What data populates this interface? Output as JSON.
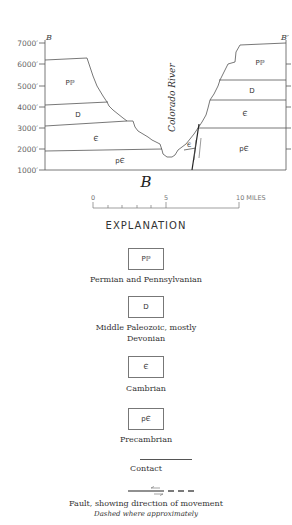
{
  "diagram": {
    "title": "B",
    "section_endpoints": {
      "left": "B",
      "right": "B′"
    },
    "elevation_axis": {
      "ticks": [
        "7000′",
        "6000′",
        "5000′",
        "4000′",
        "3000′",
        "2000′",
        "1000′"
      ]
    },
    "river_label": "Colorado River",
    "units": {
      "left": [
        {
          "symbol": "Pℙ",
          "name": "Permian and Pennsylvanian"
        },
        {
          "symbol": "D",
          "name": "Middle Paleozoic, mostly Devonian"
        },
        {
          "symbol": "Є",
          "name": "Cambrian"
        },
        {
          "symbol": "pЄ",
          "name": "Precambrian"
        }
      ],
      "right": [
        {
          "symbol": "Pℙ"
        },
        {
          "symbol": "D"
        },
        {
          "symbol": "Є"
        },
        {
          "symbol": "pЄ"
        }
      ],
      "fault_block_symbol": "Є"
    },
    "scale_bar": {
      "labels": [
        "0",
        "5",
        "10 MILES"
      ]
    }
  },
  "legend": {
    "heading": "EXPLANATION",
    "items": [
      {
        "symbol": "Pℙ",
        "label": "Permian and Pennsylvanian"
      },
      {
        "symbol": "D",
        "label_line1": "Middle Paleozoic, mostly",
        "label_line2": "Devonian"
      },
      {
        "symbol": "Є",
        "label": "Cambrian"
      },
      {
        "symbol": "pЄ",
        "label": "Precambrian"
      }
    ],
    "contact_label": "Contact",
    "fault_label": "Fault, showing direction of movement",
    "fault_sublabel": "Dashed where approximately"
  }
}
